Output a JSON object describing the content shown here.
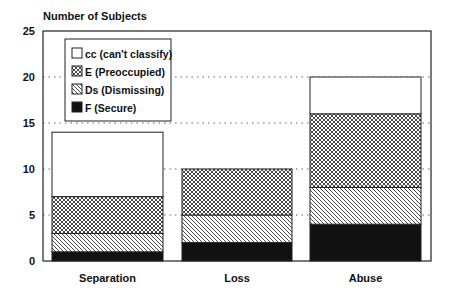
{
  "chart_data": {
    "type": "bar",
    "stacked": true,
    "title": "",
    "ylabel": "Number of Subjects",
    "xlabel": "",
    "categories": [
      "Separation",
      "Loss",
      "Abuse"
    ],
    "series": [
      {
        "name": "F (Secure)",
        "pattern": "solid-black",
        "values": [
          1,
          2,
          4
        ]
      },
      {
        "name": "Ds (Dismissing)",
        "pattern": "diagonal-hatch",
        "values": [
          2,
          3,
          4
        ]
      },
      {
        "name": "E (Preoccupied)",
        "pattern": "crosshatch",
        "values": [
          4,
          5,
          8
        ]
      },
      {
        "name": "cc (can't classify)",
        "pattern": "white",
        "values": [
          7,
          0,
          4
        ]
      }
    ],
    "totals": [
      14,
      10,
      20
    ],
    "ylim": [
      0,
      25
    ],
    "yticks": [
      0,
      5,
      10,
      15,
      20,
      25
    ],
    "grid": "dotted horizontal",
    "legend": {
      "position": "upper-left inside",
      "entries": [
        "cc (can't classify)",
        "E (Preoccupied)",
        "Ds (Dismissing)",
        "F (Secure)"
      ]
    }
  }
}
